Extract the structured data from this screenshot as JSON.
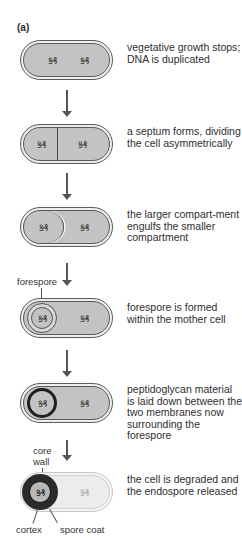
{
  "panel_label": "(a)",
  "stages": [
    {
      "id": "stage-1",
      "description": "vegetative growth stops; DNA is duplicated"
    },
    {
      "id": "stage-2",
      "description": "a septum forms, dividing the cell asymmetrically"
    },
    {
      "id": "stage-3",
      "description": "the larger compart-ment engulfs the smaller compartment"
    },
    {
      "id": "stage-4",
      "description": "forespore is formed within the mother cell"
    },
    {
      "id": "stage-5",
      "description": "peptidoglycan material is laid down between the two membranes now surrounding the forespore"
    },
    {
      "id": "stage-6",
      "description": "the cell is degraded and the endospore released"
    }
  ],
  "labels": {
    "forespore": "forespore",
    "core": "core",
    "wall": "wall",
    "cortex": "cortex",
    "spore_coat": "spore coat"
  },
  "dna_glyph": "ꝸ₰",
  "colors": {
    "cytoplasm": "#c3c3c3",
    "membrane": "#5a5a5a",
    "arrow": "#555555",
    "cortex": "#222222"
  }
}
